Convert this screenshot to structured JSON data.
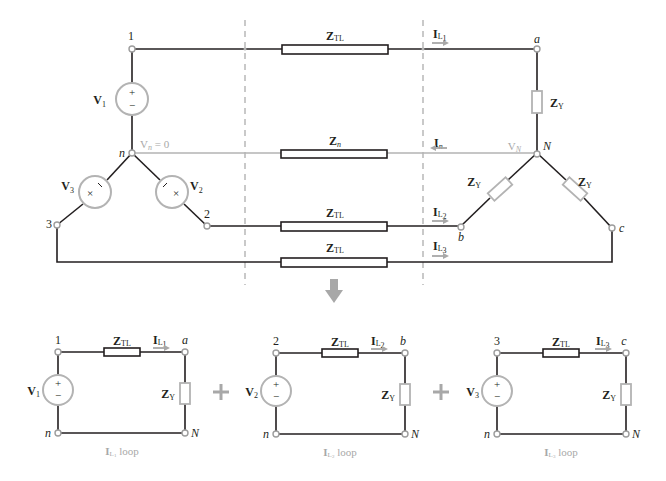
{
  "diagram": {
    "colors": {
      "wire": "#231f20",
      "neutral_wire": "#b3b3b3",
      "source_outline": "#b3b3b3",
      "load_outline": "#b3b3b3",
      "current_arrow": "#a8a8a8",
      "divider": "#b3b3b3"
    },
    "top": {
      "source_nodes": {
        "n1": "1",
        "n2": "2",
        "n3": "3",
        "n": "n"
      },
      "load_nodes": {
        "a": "a",
        "b": "b",
        "c": "c",
        "N": "N"
      },
      "sources": [
        {
          "id": "V1",
          "main": "V",
          "sub": "1",
          "polarity": [
            "+",
            "−"
          ]
        },
        {
          "id": "V2",
          "main": "V",
          "sub": "2",
          "polarity": [
            "+",
            "−"
          ]
        },
        {
          "id": "V3",
          "main": "V",
          "sub": "3",
          "polarity": [
            "+",
            "−"
          ]
        }
      ],
      "neutral_source_label": {
        "main": "V",
        "sub": "n",
        "rest": " = 0"
      },
      "neutral_load_label": {
        "main": "V",
        "sub": "N"
      },
      "line_impedance": {
        "main": "Z",
        "sub": "TL"
      },
      "neutral_impedance": {
        "main": "Z",
        "sub": "n"
      },
      "load_impedance": {
        "main": "Z",
        "sub": "Y"
      },
      "currents": [
        {
          "id": "IL1",
          "main": "I",
          "sub": "L",
          "subsub": "1",
          "direction": "right"
        },
        {
          "id": "In",
          "main": "I",
          "sub": "n",
          "direction": "left"
        },
        {
          "id": "IL2",
          "main": "I",
          "sub": "L",
          "subsub": "2",
          "direction": "right"
        },
        {
          "id": "IL3",
          "main": "I",
          "sub": "L",
          "subsub": "3",
          "direction": "right"
        }
      ]
    },
    "decomposition_arrow": "down-arrow",
    "plus_sign": "+",
    "loops": [
      {
        "node_top_left": "1",
        "node_top_right": "a",
        "node_bottom_left": "n",
        "node_bottom_right": "N",
        "source": {
          "main": "V",
          "sub": "1"
        },
        "line_z": {
          "main": "Z",
          "sub": "TL"
        },
        "load_z": {
          "main": "Z",
          "sub": "Y"
        },
        "current": {
          "main": "I",
          "sub": "L",
          "subsub": "1"
        },
        "caption_suffix": " loop"
      },
      {
        "node_top_left": "2",
        "node_top_right": "b",
        "node_bottom_left": "n",
        "node_bottom_right": "N",
        "source": {
          "main": "V",
          "sub": "2"
        },
        "line_z": {
          "main": "Z",
          "sub": "TL"
        },
        "load_z": {
          "main": "Z",
          "sub": "Y"
        },
        "current": {
          "main": "I",
          "sub": "L",
          "subsub": "2"
        },
        "caption_suffix": " loop"
      },
      {
        "node_top_left": "3",
        "node_top_right": "c",
        "node_bottom_left": "n",
        "node_bottom_right": "N",
        "source": {
          "main": "V",
          "sub": "3"
        },
        "line_z": {
          "main": "Z",
          "sub": "TL"
        },
        "load_z": {
          "main": "Z",
          "sub": "Y"
        },
        "current": {
          "main": "I",
          "sub": "L",
          "subsub": "3"
        },
        "caption_suffix": " loop"
      }
    ]
  }
}
